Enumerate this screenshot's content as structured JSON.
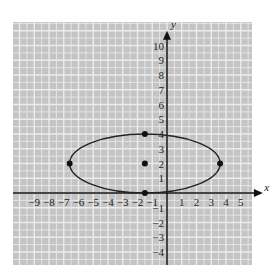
{
  "chart_data": {
    "type": "scatter",
    "title": "",
    "xlabel": "x",
    "ylabel": "y",
    "xlim": [
      -9,
      5
    ],
    "ylim": [
      -4,
      10
    ],
    "grid": true,
    "x_ticks": [
      -9,
      -8,
      -7,
      -6,
      -5,
      -4,
      -3,
      -2,
      -1,
      1,
      2,
      3,
      4,
      5
    ],
    "y_ticks": [
      -4,
      -3,
      -2,
      -1,
      1,
      2,
      3,
      4,
      5,
      6,
      7,
      8,
      9,
      10
    ],
    "x_tick_labels": [
      "−9",
      "−8",
      "−7",
      "−6",
      "−5",
      "−4",
      "−3",
      "−2",
      "−1",
      "1",
      "2",
      "3",
      "4",
      "5"
    ],
    "y_tick_labels": [
      "−4",
      "−3",
      "−2",
      "−1",
      "1",
      "2",
      "3",
      "4",
      "5",
      "6",
      "7",
      "8",
      "9",
      "10"
    ],
    "ellipse": {
      "center": [
        -1.5,
        2
      ],
      "semi_major_x": 5.1,
      "semi_minor_y": 2
    },
    "points": [
      {
        "x": -1.5,
        "y": 2,
        "label": "center"
      },
      {
        "x": -1.5,
        "y": 4,
        "label": "top vertex"
      },
      {
        "x": -1.5,
        "y": 0,
        "label": "bottom vertex"
      },
      {
        "x": -6.6,
        "y": 2,
        "label": "left vertex"
      },
      {
        "x": 3.6,
        "y": 2,
        "label": "right vertex"
      }
    ],
    "colors": {
      "grid_bg": "#c4c4c4",
      "grid_line": "#ececec",
      "curve": "#222222"
    }
  },
  "axes": {
    "x_label": "x",
    "y_label": "y"
  }
}
